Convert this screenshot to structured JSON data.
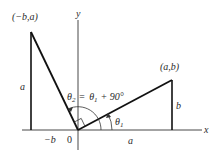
{
  "diagram": {
    "axes": {
      "x_label": "x",
      "y_label": "y",
      "origin_label": "0"
    },
    "points": {
      "rotated": "(−b,a)",
      "original": "(a,b)"
    },
    "segments": {
      "left_height": "a",
      "left_base": "−b",
      "right_height": "b",
      "right_base": "a"
    },
    "angles": {
      "theta1_symbol": "θ",
      "theta1_sub": "1",
      "theta2_symbol": "θ",
      "theta2_sub": "2",
      "equation_eq": "=",
      "equation_theta": "θ",
      "equation_theta_sub": "1",
      "equation_plus": "+ 90°"
    },
    "colors": {
      "ink": "#1a1a1a",
      "background": "#ffffff"
    }
  }
}
